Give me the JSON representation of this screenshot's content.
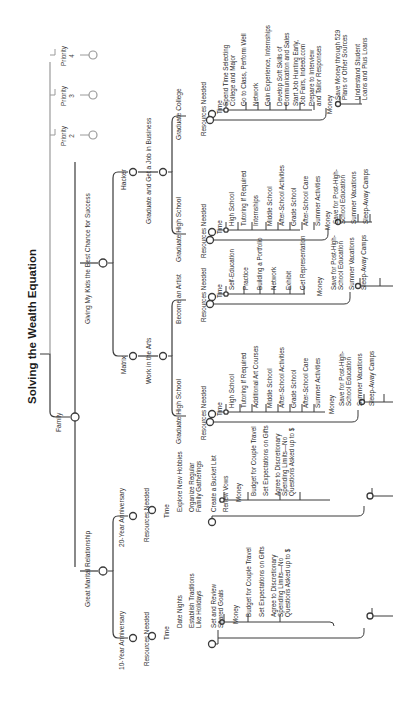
{
  "title": "Solving the Wealth Equation",
  "root": {
    "label": "Family",
    "branches": {
      "marital": {
        "label": "Great Marital Relationship",
        "ten_year": {
          "label": "10-Year Anniversary",
          "resources": "Resources Needed",
          "time": {
            "label": "Time",
            "items": [
              "Date Nights",
              "Establish Traditions\nLike Holidays",
              "Set and Review\nShared Goals"
            ]
          },
          "money": {
            "label": "Money",
            "items": [
              "Budget for Couple Travel",
              "Set Expectations on Gifts",
              "Agree to Discretionary\nSpending Limits—No\nQuestions Asked up to $"
            ]
          }
        },
        "twenty_year": {
          "label": "20-Year Anniversary",
          "resources": "Resources Needed",
          "time": {
            "label": "Time",
            "items": [
              "Explore New Hobbies",
              "Organize Regular\nFamily Gatherings",
              "Create a Bucket List",
              "Renew Vows"
            ]
          },
          "money": {
            "label": "Money",
            "items": [
              "Budget for Couple Travel",
              "Set Expectations on Gifts",
              "Agree to Discretionary\nSpending Limits—No\nQuestions Asked up to $"
            ]
          }
        }
      },
      "kids": {
        "label": "Giving My Kids the Best Chance for Success",
        "matrix": {
          "label": "Matrix",
          "path": "Work in the Arts",
          "grad_hs": {
            "label": "Graduate High School",
            "resources": "Resources Needed",
            "time": {
              "label": "Time",
              "items": [
                "High School",
                "Tutoring If Required",
                "Additional Art Courses",
                "Middle School",
                "After-School Activities",
                "Grade School",
                "After-School Care",
                "Summer Activities"
              ]
            },
            "money": {
              "label": "Money",
              "items": [
                "Save for Post-High-\nSchool Education",
                "Summer Vacations",
                "Sleep-Away Camps"
              ]
            }
          },
          "artist": {
            "label": "Become an Artist",
            "resources": "Resources Needed",
            "time": {
              "label": "Time",
              "items": [
                "Self-Education",
                "Practice",
                "Building a Portfolio",
                "Network",
                "Exhibit",
                "Get Representation"
              ]
            },
            "money": {
              "label": "Money",
              "items": [
                "Save for Post-High-\nSchool Education",
                "Summer Vacations",
                "Sleep-Away Camps"
              ]
            }
          }
        },
        "hacker": {
          "label": "Hacker",
          "path": "Graduate and Get a Job in Business",
          "grad_hs": {
            "label": "Graduate High School",
            "resources": "Resources Needed",
            "time": {
              "label": "Time",
              "items": [
                "High School",
                "Tutoring If Required",
                "Internships",
                "Middle School",
                "After-School Activities",
                "Grade School",
                "After-School Care",
                "Summer Activities"
              ]
            },
            "money": {
              "label": "Money",
              "items": [
                "Save for Post-High-\nSchool Education",
                "Summer Vacations",
                "Sleep-Away Camps"
              ]
            }
          },
          "grad_college": {
            "label": "Graduate College",
            "resources": "Resources Needed",
            "time": {
              "label": "Time",
              "items": [
                "Spend Time Selecting\nCollege and Major",
                "Go to Class, Perform Well",
                "Network",
                "Gain Experience, Internships",
                "Develop Soft Skills of\nCommunication and Sales",
                "Start Job Hunting Early,\nJob Fairs, Indeed.com",
                "Prepare to Interview\nand Tailor Responses"
              ]
            },
            "money": {
              "label": "Money",
              "items": [
                "Save Money through 529\nPlans or Other Sources",
                "Understand Student\nLoans and Plus Loans"
              ]
            }
          }
        }
      },
      "priorities": [
        {
          "label": "Priority\n2"
        },
        {
          "label": "Priority\n3"
        },
        {
          "label": "Priority\n4"
        }
      ]
    }
  },
  "colors": {
    "line": "#3a3a3a",
    "muted_line": "#9a9a9a",
    "text": "#2a2a2a"
  }
}
